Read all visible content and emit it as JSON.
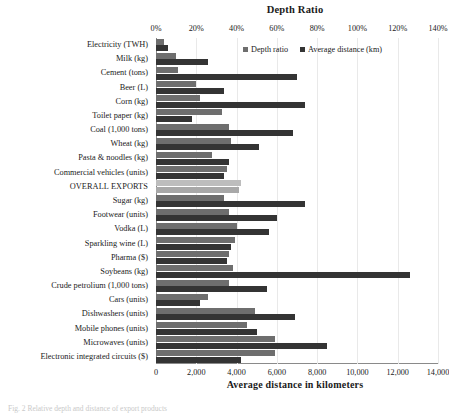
{
  "chart": {
    "top_axis_title": "Depth Ratio",
    "bottom_axis_title": "Average distance in kilometers",
    "legend": {
      "depth_label": "Depth ratio",
      "distance_label": "Average distance (km)"
    },
    "caption": "Fig. 2 Relative depth and distance of export products"
  },
  "chart_data": {
    "type": "bar",
    "orientation": "horizontal",
    "title": "Depth Ratio",
    "xlabel": "Average distance in kilometers",
    "xlabel_secondary": "Depth Ratio",
    "ylabel": "",
    "grid": true,
    "legend_position": "top-right",
    "categories": [
      "Electricity (TWH)",
      "Milk (kg)",
      "Cement (tons)",
      "Beer (L)",
      "Corn (kg)",
      "Toilet paper (kg)",
      "Coal (1,000 tons)",
      "Wheat (kg)",
      "Pasta & noodles (kg)",
      "Commercial vehicles (units)",
      "OVERALL EXPORTS",
      "Sugar (kg)",
      "Footwear (units)",
      "Vodka (L)",
      "Sparkling wine (L)",
      "Pharma ($)",
      "Soybeans (kg)",
      "Crude petrolium (1,000 tons)",
      "Cars (units)",
      "Dishwashers (units)",
      "Mobile phones (units)",
      "Microwaves (units)",
      "Electronic integrated circuits ($)"
    ],
    "highlight_category": "OVERALL EXPORTS",
    "series": [
      {
        "name": "Depth ratio",
        "unit": "%",
        "axis": "top",
        "axis_ticks": [
          "0%",
          "20%",
          "40%",
          "60%",
          "80%",
          "100%",
          "120%",
          "140%"
        ],
        "axis_range": [
          0,
          140
        ],
        "color": "#6e6e6e",
        "values": [
          4,
          10,
          11,
          20,
          22,
          33,
          36,
          37,
          28,
          35,
          42,
          34,
          36,
          40,
          39,
          36,
          38,
          36,
          26,
          49,
          45,
          59,
          59
        ]
      },
      {
        "name": "Average distance (km)",
        "unit": "km",
        "axis": "bottom",
        "axis_ticks": [
          "0",
          "2,000",
          "4,000",
          "6,000",
          "8,000",
          "10,000",
          "12,000",
          "14,000"
        ],
        "axis_range": [
          0,
          14000
        ],
        "color": "#343434",
        "values": [
          600,
          2600,
          7000,
          3400,
          7400,
          1800,
          6800,
          5100,
          3600,
          3400,
          4100,
          7400,
          6000,
          5600,
          3700,
          3500,
          12600,
          5500,
          2200,
          6900,
          5000,
          8500,
          4200
        ]
      }
    ]
  }
}
